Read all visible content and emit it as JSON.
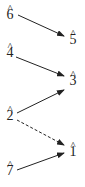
{
  "diagram": {
    "type": "voice-leading scale-degree diagram",
    "nodes": [
      {
        "id": "d6",
        "label": "6",
        "hat": "^",
        "x": 4,
        "y": 8
      },
      {
        "id": "d5",
        "label": "5",
        "hat": "^",
        "x": 67,
        "y": 33
      },
      {
        "id": "d4",
        "label": "4",
        "hat": "^",
        "x": 4,
        "y": 46
      },
      {
        "id": "d3",
        "label": "3",
        "hat": "^",
        "x": 67,
        "y": 74
      },
      {
        "id": "d2",
        "label": "2",
        "hat": "^",
        "x": 4,
        "y": 109
      },
      {
        "id": "d1",
        "label": "1",
        "hat": "^",
        "x": 67,
        "y": 145
      },
      {
        "id": "d7",
        "label": "7",
        "hat": "^",
        "x": 4,
        "y": 164
      }
    ],
    "edges": [
      {
        "from": "6",
        "to": "5",
        "style": "solid"
      },
      {
        "from": "4",
        "to": "3",
        "style": "solid"
      },
      {
        "from": "2",
        "to": "3",
        "style": "solid"
      },
      {
        "from": "2",
        "to": "1",
        "style": "dashed"
      },
      {
        "from": "7",
        "to": "1",
        "style": "solid"
      }
    ]
  }
}
